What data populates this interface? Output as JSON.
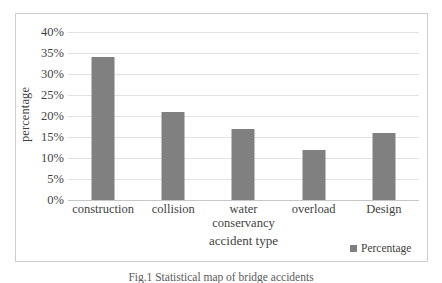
{
  "chart_data": {
    "type": "bar",
    "title": "",
    "categories": [
      "construction",
      "collision",
      "water conservancy",
      "overload",
      "Design"
    ],
    "category_lines": [
      [
        "construction"
      ],
      [
        "collision"
      ],
      [
        "water",
        "conservancy"
      ],
      [
        "overload"
      ],
      [
        "Design"
      ]
    ],
    "values": [
      34,
      21,
      17,
      12,
      16
    ],
    "value_labels": [
      "34%",
      "21%",
      "17%",
      "12%",
      "16%"
    ],
    "series": [
      {
        "name": "Percentage",
        "values": [
          34,
          21,
          17,
          12,
          16
        ]
      }
    ],
    "xlabel": "accident type",
    "ylabel": "percentage",
    "ylim": [
      0,
      40
    ],
    "ytick_step": 5,
    "ytick_labels": [
      "40%",
      "35%",
      "30%",
      "25%",
      "20%",
      "15%",
      "10%",
      "5%",
      "0%"
    ],
    "ytick_values": [
      40,
      35,
      30,
      25,
      20,
      15,
      10,
      5,
      0
    ],
    "grid": true,
    "grid_axis": "y",
    "legend": {
      "position": "bottom-right",
      "entries": [
        "Percentage"
      ]
    },
    "colors": {
      "bar": "#808080",
      "gridline": "#e2e2e2",
      "baseline": "#c6c6c6",
      "frame": "#cfcfcf",
      "text": "#3f3f3f",
      "background": "#ffffff"
    }
  },
  "axes": {
    "y_title": "percentage",
    "x_title": "accident type"
  },
  "legend": {
    "label": "Percentage"
  },
  "caption": {
    "text": "Fig.1 Statistical map of bridge accidents"
  }
}
